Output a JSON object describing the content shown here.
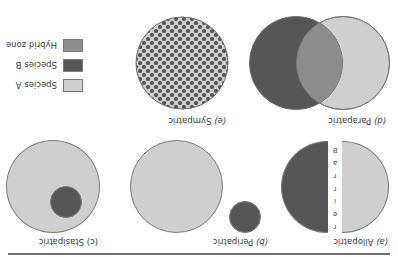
{
  "colors": {
    "species_a": "#cfcfcf",
    "species_b": "#565656",
    "hybrid_zone": "#8c8c8c",
    "outline": "#7a7a7a"
  },
  "panels": [
    {
      "id": "a",
      "letter": "(a)",
      "name": "Allopatric",
      "barrier_label": "Barrier"
    },
    {
      "id": "b",
      "letter": "(b)",
      "name": "Peripatric"
    },
    {
      "id": "c",
      "letter": "(c)",
      "name": "Stasipatric"
    },
    {
      "id": "d",
      "letter": "(d)",
      "name": "Parapatric"
    },
    {
      "id": "e",
      "letter": "(e)",
      "name": "Sympatric"
    }
  ],
  "barrier_letters": [
    "B",
    "a",
    "r",
    "r",
    "i",
    "e",
    "r"
  ],
  "legend": [
    {
      "label": "Species A",
      "color": "#cfcfcf"
    },
    {
      "label": "Species B",
      "color": "#565656"
    },
    {
      "label": "Hybrid zone",
      "color": "#8c8c8c"
    }
  ],
  "orientation": "rotated 180 degrees"
}
